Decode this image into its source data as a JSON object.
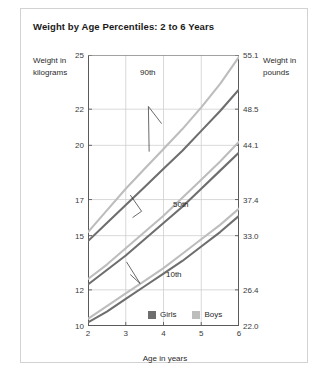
{
  "chart_title": "Weight by Age Percentiles: 2 to 6 Years",
  "axes": {
    "y_left_title": "Weight in kilograms",
    "y_right_title": "Weight in pounds",
    "x_title": "Age in years",
    "y_left_ticks": [
      "25",
      "22",
      "20",
      "17",
      "15",
      "12",
      "10"
    ],
    "y_right_ticks": [
      "55.1",
      "48.5",
      "44.1",
      "37.4",
      "33.0",
      "26.4",
      "22.0"
    ],
    "x_ticks": [
      "2",
      "3",
      "4",
      "5",
      "6"
    ]
  },
  "legend": {
    "items": [
      {
        "label": "Girls",
        "color": "#6e6e6e"
      },
      {
        "label": "Boys",
        "color": "#bdbdbd"
      }
    ]
  },
  "annotations": {
    "p90": "90th",
    "p50": "50th",
    "p10": "10th"
  },
  "chart_data": {
    "type": "line",
    "title": "Weight by Age Percentiles: 2 to 6 Years",
    "xlabel": "Age in years",
    "ylabel": "Weight in kilograms",
    "ylabel_secondary": "Weight in pounds",
    "grid": true,
    "legend_position": "bottom-center",
    "xlim": [
      2,
      6
    ],
    "ylim": [
      10,
      25
    ],
    "ylim_secondary": [
      22.0,
      55.1
    ],
    "x": [
      2,
      2.5,
      3,
      3.5,
      4,
      4.5,
      5,
      5.5,
      6
    ],
    "y_ticks": [
      10,
      12,
      15,
      17,
      20,
      22,
      25
    ],
    "y_ticks_secondary": [
      22.0,
      26.4,
      33.0,
      37.4,
      44.1,
      48.5,
      55.1
    ],
    "series": [
      {
        "name": "Boys 90th",
        "percentile": "90th",
        "group": "Boys",
        "color": "#bdbdbd",
        "values": [
          15.2,
          16.4,
          17.6,
          18.7,
          19.8,
          20.9,
          22.1,
          23.4,
          24.9
        ]
      },
      {
        "name": "Girls 90th",
        "percentile": "90th",
        "group": "Girls",
        "color": "#6e6e6e",
        "values": [
          14.7,
          15.7,
          16.7,
          17.7,
          18.7,
          19.7,
          20.8,
          21.9,
          23.1
        ]
      },
      {
        "name": "Boys 50th",
        "percentile": "50th",
        "group": "Boys",
        "color": "#bdbdbd",
        "values": [
          12.6,
          13.4,
          14.3,
          15.2,
          16.1,
          17.1,
          18.1,
          19.1,
          20.2
        ]
      },
      {
        "name": "Girls 50th",
        "percentile": "50th",
        "group": "Girls",
        "color": "#6e6e6e",
        "values": [
          12.3,
          13.1,
          13.9,
          14.8,
          15.7,
          16.6,
          17.6,
          18.6,
          19.6
        ]
      },
      {
        "name": "Boys 10th",
        "percentile": "10th",
        "group": "Boys",
        "color": "#bdbdbd",
        "values": [
          10.4,
          11.1,
          11.8,
          12.5,
          13.2,
          14.0,
          14.8,
          15.6,
          16.5
        ]
      },
      {
        "name": "Girls 10th",
        "percentile": "10th",
        "group": "Girls",
        "color": "#6e6e6e",
        "values": [
          10.2,
          10.8,
          11.5,
          12.2,
          12.9,
          13.6,
          14.4,
          15.2,
          16.1
        ]
      }
    ]
  }
}
